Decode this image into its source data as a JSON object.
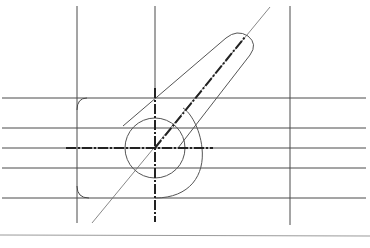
{
  "diagram": {
    "type": "technical-drawing",
    "colors": {
      "background": "#ffffff",
      "line": "#4a4a4a",
      "thin_line": "#6a6a6a",
      "center_line": "#222222",
      "border": "#9a9a9a"
    },
    "vertical_guides_x": [
      77,
      155,
      290
    ],
    "horizontal_guides_y": [
      98,
      128,
      148,
      168,
      198
    ],
    "center": {
      "x": 155,
      "y": 148
    },
    "circle_radius": 30,
    "slot_angle_deg": 51,
    "bottom_border_y": 235
  }
}
